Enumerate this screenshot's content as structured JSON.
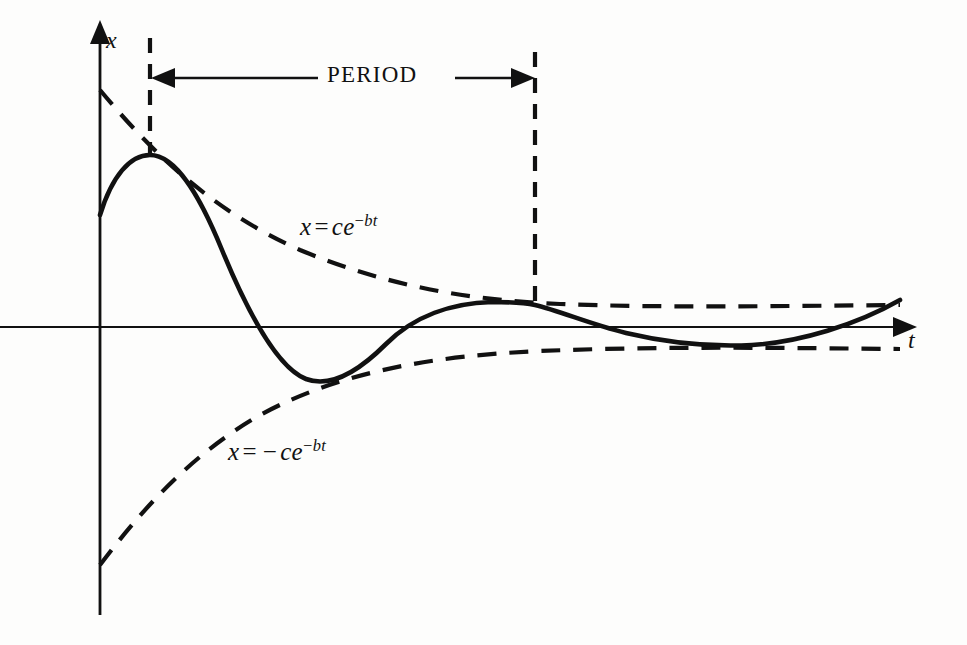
{
  "figure": {
    "background_color": "#fdfdfc",
    "ink_color": "#111111"
  },
  "axes": {
    "vertical_label": "x",
    "horizontal_label": "t",
    "origin": [
      100,
      327
    ],
    "vertical_extent": [
      24,
      615
    ],
    "horizontal_extent": [
      0,
      905
    ]
  },
  "annotations": {
    "period_label": "PERIOD",
    "period_start_x": 150,
    "period_end_x": 535,
    "period_arrow_y": 78,
    "upper_envelope_label": {
      "lhs": "x",
      "equals": "=",
      "base": "ce",
      "exp_minus": "−",
      "exp_body": "bt",
      "plain": "x = ce^{-bt}"
    },
    "lower_envelope_label": {
      "lhs": "x",
      "equals": "=",
      "sign": "−",
      "base": "ce",
      "exp_minus": "−",
      "exp_body": "bt",
      "plain": "x = -ce^{-bt}"
    }
  },
  "chart_data": {
    "type": "line",
    "xlabel": "t",
    "ylabel": "x",
    "grid": false,
    "legend": "none",
    "xlim": [
      0,
      905
    ],
    "ylim": [
      -1,
      1
    ],
    "series": [
      {
        "name": "x = ce^{-bt}",
        "style": "dashed",
        "role": "upper-envelope",
        "path": "M100,90 C150,150 210,210 300,250 C390,287 470,300 560,304 C660,308 780,306 900,305"
      },
      {
        "name": "x = -ce^{-bt}",
        "style": "dashed",
        "role": "lower-envelope",
        "path": "M100,565 C140,512 190,455 260,415 C340,372 430,356 540,351 C660,346 790,348 900,349"
      },
      {
        "name": "damped oscillation",
        "style": "solid",
        "role": "signal",
        "path": "M100,215 C112,176 130,155 150,155 C176,155 200,196 222,250 C248,313 278,368 306,379 C330,388 358,372 386,344 C414,316 452,303 492,302 C512,302 526,303 535,305 C560,311 590,324 626,333 C668,343 712,347 752,345 C800,342 856,325 900,300",
        "key_points": {
          "start": [
            100,
            215
          ],
          "peak_1": [
            150,
            155
          ],
          "zero_1": [
            242,
            327
          ],
          "trough_1": [
            330,
            380
          ],
          "zero_2": [
            432,
            327
          ],
          "peak_2": [
            535,
            305
          ],
          "zero_3": [
            640,
            327
          ],
          "trough_2": [
            740,
            345
          ],
          "end": [
            900,
            300
          ]
        }
      }
    ],
    "notes": [
      "Solid curve touches upper envelope at peaks and lower envelope at troughs.",
      "Period is the horizontal distance between successive peaks (x = 150 to x = 535)."
    ]
  }
}
